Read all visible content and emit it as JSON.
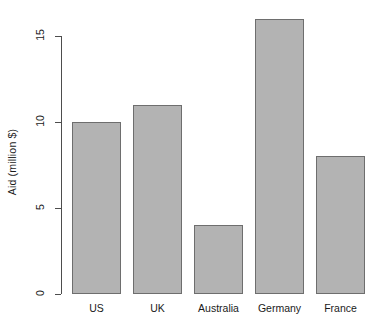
{
  "chart_data": {
    "type": "bar",
    "title": "",
    "subtitle": "",
    "categories": [
      "US",
      "UK",
      "Australia",
      "Germany",
      "France"
    ],
    "values": [
      10,
      11,
      4,
      16,
      8
    ],
    "xlabel": "",
    "ylabel": "Aid (million $)",
    "ylim": [
      0,
      16.5
    ],
    "yaxis_line_range": [
      0,
      15
    ],
    "yticks": [
      0,
      5,
      10,
      15
    ],
    "ytick_labels": [
      "0",
      "5",
      "10",
      "15"
    ],
    "grid": false,
    "legend": null,
    "bar_fill_color": "#b3b3b3",
    "bar_border_color": "#6e6e6e",
    "axis_color": "#4d4d4d",
    "text_color": "#1a1a1a",
    "background_color": "#ffffff"
  },
  "axis": {
    "y_label": "Aid (million $)",
    "ticks": [
      {
        "label": "15",
        "value": 15
      },
      {
        "label": "10",
        "value": 10
      },
      {
        "label": "5",
        "value": 5
      },
      {
        "label": "0",
        "value": 0
      }
    ]
  },
  "bars": [
    {
      "label": "US",
      "value": 10
    },
    {
      "label": "UK",
      "value": 11
    },
    {
      "label": "Australia",
      "value": 4
    },
    {
      "label": "Germany",
      "value": 16
    },
    {
      "label": "France",
      "value": 8
    }
  ]
}
